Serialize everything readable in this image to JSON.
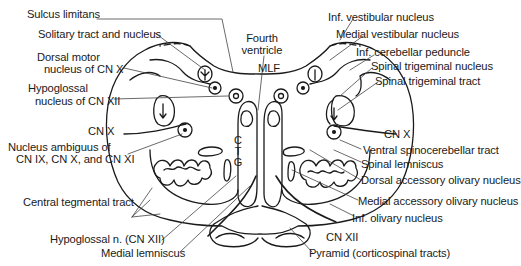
{
  "diagram": {
    "labels_left": [
      {
        "id": "sulcus_limitans",
        "text": "Sulcus limitans"
      },
      {
        "id": "solitary",
        "text": "Solitary tract and nucleus"
      },
      {
        "id": "dorsal_motor_1",
        "text": "Dorsal motor"
      },
      {
        "id": "dorsal_motor_2",
        "text": "nucleus of CN X"
      },
      {
        "id": "hypoglossal_nuc_1",
        "text": "Hypoglossal"
      },
      {
        "id": "hypoglossal_nuc_2",
        "text": "nucleus of CN XII"
      },
      {
        "id": "cnx_left",
        "text": "CN X"
      },
      {
        "id": "ambiguus_1",
        "text": "Nucleus ambiguus of"
      },
      {
        "id": "ambiguus_2",
        "text": "CN IX, CN X, and CN XI"
      },
      {
        "id": "central_tegmental",
        "text": "Central tegmental tract"
      },
      {
        "id": "hypoglossal_n",
        "text": "Hypoglossal n. (CN XII)"
      },
      {
        "id": "medial_lemniscus",
        "text": "Medial lemniscus"
      }
    ],
    "labels_center": [
      {
        "id": "fourth_1",
        "text": "Fourth"
      },
      {
        "id": "fourth_2",
        "text": "ventricle"
      },
      {
        "id": "mlf",
        "text": "MLF"
      },
      {
        "id": "ctg",
        "letters": [
          "C",
          "T",
          "G"
        ]
      }
    ],
    "labels_right": [
      {
        "id": "inf_vestibular",
        "text": "Inf. vestibular nucleus"
      },
      {
        "id": "medial_vestibular",
        "text": "Medial vestibular nucleus"
      },
      {
        "id": "inf_cerebellar",
        "text": "Inf. cerebellar peduncle"
      },
      {
        "id": "spinal_trig_nuc",
        "text": "Spinal trigeminal nucleus"
      },
      {
        "id": "spinal_trig_tract",
        "text": "Spinal trigeminal tract"
      },
      {
        "id": "cnx_right",
        "text": "CN X"
      },
      {
        "id": "ventral_spinocerebellar",
        "text": "Ventral spinocerebellar tract"
      },
      {
        "id": "spinal_lemniscus",
        "text": "Spinal lemniscus"
      },
      {
        "id": "dorsal_accessory",
        "text": "Dorsal accessory olivary nucleus"
      },
      {
        "id": "medial_accessory",
        "text": "Medial accessory olivary nucleus"
      },
      {
        "id": "inf_olivary",
        "text": "Inf. olivary nucleus"
      },
      {
        "id": "cnxii_right",
        "text": "CN XII"
      },
      {
        "id": "pyramid",
        "text": "Pyramid (corticospinal tracts)"
      }
    ],
    "colors": {
      "line": "#1a1a1a",
      "leader": "#444444",
      "background": "#ffffff"
    }
  }
}
